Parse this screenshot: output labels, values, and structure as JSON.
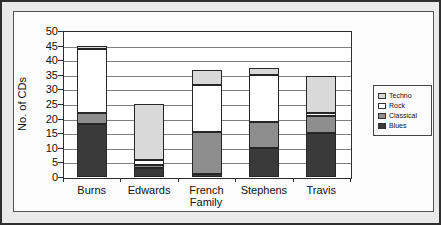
{
  "chart_data": {
    "type": "bar",
    "stacked": true,
    "categories": [
      "Burns",
      "Edwards",
      "French",
      "Stephens",
      "Travis"
    ],
    "series": [
      {
        "name": "Blues",
        "color": "#3a3a3a",
        "values": [
          18,
          3,
          1,
          10,
          15
        ]
      },
      {
        "name": "Classical",
        "color": "#8e8e8e",
        "values": [
          4,
          1,
          14.5,
          9,
          6
        ]
      },
      {
        "name": "Rock",
        "color": "#ffffff",
        "values": [
          22,
          2,
          16,
          16,
          1
        ]
      },
      {
        "name": "Techno",
        "color": "#d9d9d9",
        "values": [
          1,
          19,
          5,
          2.5,
          12.5
        ]
      }
    ],
    "totals": [
      45,
      25,
      36.5,
      37.5,
      34.5
    ],
    "xlabel": "Family",
    "ylabel": "No. of CDs",
    "ylim": [
      0,
      50
    ],
    "yticks": [
      0,
      5,
      10,
      15,
      20,
      25,
      30,
      35,
      40,
      45,
      50
    ],
    "grid": true,
    "legend": {
      "position": "right",
      "entries": [
        "Techno",
        "Rock",
        "Classical",
        "Blues"
      ]
    }
  }
}
